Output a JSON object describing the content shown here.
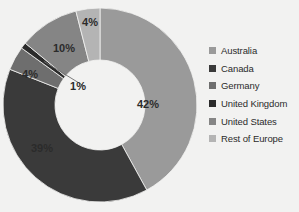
{
  "chart_data": {
    "type": "pie",
    "variant": "donut",
    "title": "",
    "subtitle": "",
    "xlabel": "",
    "ylabel": "",
    "legend_position": "right",
    "grid": false,
    "start_angle_deg": 0,
    "direction": "clockwise",
    "categories": [
      "Australia",
      "Canada",
      "Germany",
      "United Kingdom",
      "United States",
      "Rest of Europe"
    ],
    "values": [
      42,
      39,
      4,
      1,
      10,
      4
    ],
    "data_labels": [
      "42%",
      "39%",
      "4%",
      "1%",
      "10%",
      "4%"
    ],
    "colors": [
      "#9a9a9a",
      "#3a3a3a",
      "#6e6e6e",
      "#2b2b2b",
      "#858585",
      "#b4b4b4"
    ],
    "slices": [
      {
        "label": "Australia",
        "value": 42,
        "data_label": "42%",
        "color": "#9a9a9a",
        "label_color": "#2b2b2b",
        "label_x": 148,
        "label_y": 108
      },
      {
        "label": "Canada",
        "value": 39,
        "data_label": "39%",
        "color": "#3a3a3a",
        "label_x": 42,
        "label_y": 152,
        "label_color": "#f2f2f1"
      },
      {
        "label": "Germany",
        "value": 4,
        "data_label": "4%",
        "color": "#6e6e6e",
        "label_x": 30,
        "label_y": 78,
        "label_color": "#f2f2f1"
      },
      {
        "label": "United Kingdom",
        "value": 1,
        "data_label": "1%",
        "color": "#2b2b2b",
        "label_x": 78,
        "label_y": 90,
        "label_color": "#2b2b2b"
      },
      {
        "label": "United States",
        "value": 10,
        "data_label": "10%",
        "color": "#858585",
        "label_x": 64,
        "label_y": 52,
        "label_color": "#2b2b2b"
      },
      {
        "label": "Rest of Europe",
        "value": 4,
        "data_label": "4%",
        "color": "#b4b4b4",
        "label_x": 90,
        "label_y": 26,
        "label_color": "#f2f2f1"
      }
    ]
  },
  "legend": {
    "items": [
      {
        "label": "Australia",
        "color": "#9a9a9a"
      },
      {
        "label": "Canada",
        "color": "#3a3a3a"
      },
      {
        "label": "Germany",
        "color": "#6e6e6e"
      },
      {
        "label": "United Kingdom",
        "color": "#2b2b2b"
      },
      {
        "label": "United States",
        "color": "#858585"
      },
      {
        "label": "Rest of Europe",
        "color": "#b4b4b4"
      }
    ]
  },
  "style": {
    "background": "#f2f2f1",
    "donut_center_x": 100,
    "donut_center_y": 105,
    "donut_outer_radius": 97,
    "donut_inner_radius": 45,
    "hole_color": "#f7f7f6"
  }
}
